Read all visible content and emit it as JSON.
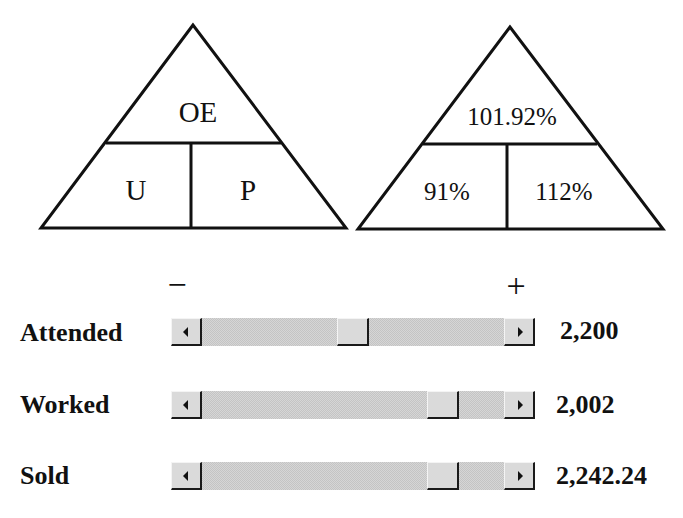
{
  "triangles": {
    "formula": {
      "top": "OE",
      "bottom_left": "U",
      "bottom_right": "P"
    },
    "values": {
      "top": "101.92%",
      "bottom_left": "91%",
      "bottom_right": "112%"
    }
  },
  "signs": {
    "minus": "−",
    "plus": "+"
  },
  "sliders": [
    {
      "label": "Attended",
      "value": "2,200",
      "thumb_left_px": 166
    },
    {
      "label": "Worked",
      "value": "2,002",
      "thumb_left_px": 256
    },
    {
      "label": "Sold",
      "value": "2,242.24",
      "thumb_left_px": 256
    }
  ],
  "icons": {
    "scroll_left": "left-arrow-icon",
    "scroll_right": "right-arrow-icon"
  }
}
